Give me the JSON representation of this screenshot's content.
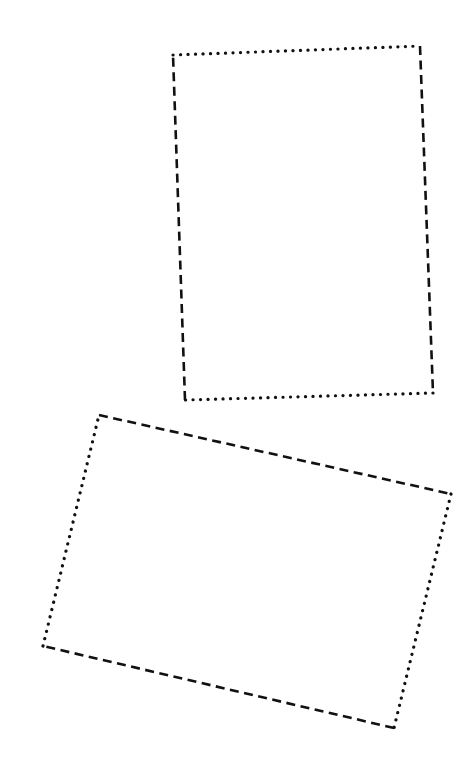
{
  "canvas": {
    "width": 476,
    "height": 768,
    "background": "#ffffff",
    "stroke_color": "#111111"
  },
  "shapes": [
    {
      "name": "upright-quadrilateral",
      "corners": {
        "top_left": [
          173,
          55
        ],
        "top_right": [
          420,
          46
        ],
        "bottom_right": [
          433,
          393
        ],
        "bottom_left": [
          185,
          400
        ]
      },
      "edges": {
        "top": "dotted",
        "right": "dashed",
        "bottom": "dotted",
        "left": "dashed"
      }
    },
    {
      "name": "tilted-quadrilateral",
      "corners": {
        "top_left": [
          99,
          415
        ],
        "top_right": [
          451,
          494
        ],
        "bottom_right": [
          394,
          728
        ],
        "bottom_left": [
          43,
          646
        ]
      },
      "edges": {
        "top": "dashed",
        "right": "dotted",
        "bottom": "dashed",
        "left": "dotted"
      }
    }
  ]
}
